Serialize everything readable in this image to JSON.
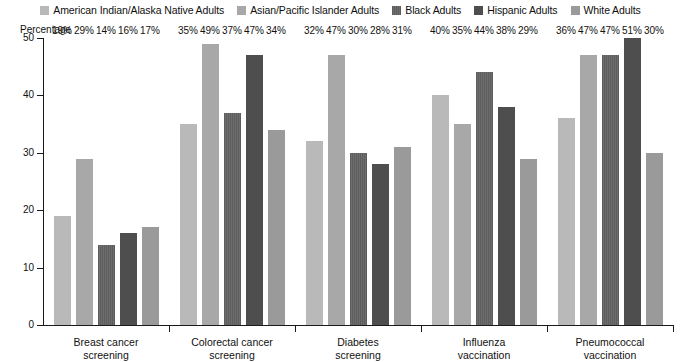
{
  "chart_data": {
    "type": "bar",
    "title": "",
    "subtitle": "",
    "xlabel": "",
    "ylabel": "Percentage",
    "ylim": [
      0,
      50
    ],
    "yticks": [
      0,
      10,
      20,
      30,
      40,
      50
    ],
    "ytick_labels": [
      "0",
      "10",
      "20",
      "30",
      "40",
      "50"
    ],
    "grid": false,
    "legend_position": "top",
    "value_label_suffix": "%",
    "categories": [
      "Breast cancer\nscreening",
      "Colorectal cancer\nscreening",
      "Diabetes\nscreening",
      "Influenza\nvaccination",
      "Pneumococcal\nvaccination"
    ],
    "series": [
      {
        "name": "American Indian/Alaska Native Adults",
        "color": "#b9b9b9",
        "values": [
          19,
          35,
          32,
          40,
          36
        ],
        "labels": [
          "19%",
          "35%",
          "32%",
          "40%",
          "36%"
        ]
      },
      {
        "name": "Asian/Pacific Islander Adults",
        "color": "#a8a8a8",
        "values": [
          29,
          49,
          47,
          35,
          47
        ],
        "labels": [
          "29%",
          "49%",
          "47%",
          "35%",
          "47%"
        ]
      },
      {
        "name": "Black Adults",
        "color": "#6e6e6e",
        "values": [
          14,
          37,
          30,
          44,
          47
        ],
        "labels": [
          "14%",
          "37%",
          "30%",
          "44%",
          "47%"
        ]
      },
      {
        "name": "Hispanic Adults",
        "color": "#4e4e4e",
        "values": [
          16,
          47,
          28,
          38,
          51
        ],
        "labels": [
          "16%",
          "47%",
          "28%",
          "38%",
          "51%"
        ]
      },
      {
        "name": "White Adults",
        "color": "#9a9a9a",
        "values": [
          17,
          34,
          31,
          29,
          30
        ],
        "labels": [
          "17%",
          "34%",
          "31%",
          "29%",
          "30%"
        ]
      }
    ]
  },
  "legend": {
    "items": [
      {
        "label": "American Indian/Alaska Native Adults",
        "color": "#b9b9b9"
      },
      {
        "label": "Asian/Pacific Islander Adults",
        "color": "#a8a8a8"
      },
      {
        "label": "Black Adults",
        "color": "#6e6e6e"
      },
      {
        "label": "Hispanic Adults",
        "color": "#4e4e4e"
      },
      {
        "label": "White Adults",
        "color": "#9a9a9a"
      }
    ]
  }
}
